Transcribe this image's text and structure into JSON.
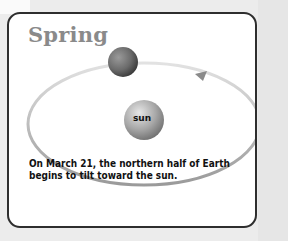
{
  "title": "Spring",
  "sun_label": "sun",
  "caption": {
    "line1": "On March 21, the northern half of Earth",
    "line2": "begins to tilt toward the sun."
  },
  "diagram": {
    "elements": [
      "orbit-ellipse",
      "earth",
      "sun",
      "orbit-direction-arrow"
    ],
    "orbit_direction": "counterclockwise"
  },
  "colors": {
    "background": "#ececec",
    "card": "#ffffff",
    "border": "#2e2e2e",
    "title": "#8a8a8a",
    "orbit": "#bdbdbd",
    "caption": "#111111"
  }
}
